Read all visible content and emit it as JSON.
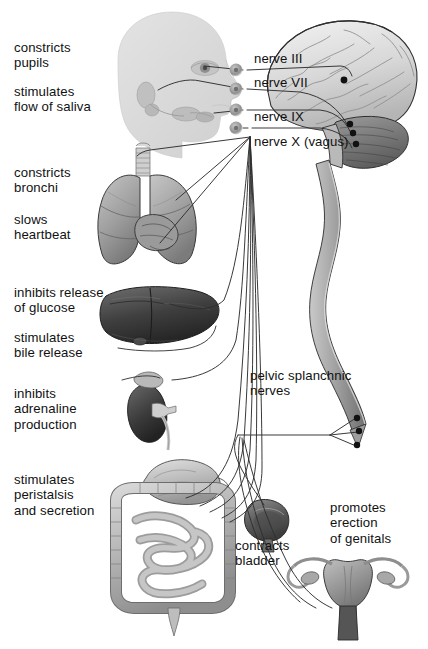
{
  "diagram": {
    "background_color": "#ffffff",
    "text_color": "#111111"
  },
  "labels": {
    "constricts_pupils": "constricts\npupils",
    "stimulates_saliva": "stimulates\nflow of saliva",
    "constricts_bronchi": "constricts\nbronchi",
    "slows_heartbeat": "slows\nheartbeat",
    "inhibits_glucose": "inhibits release\nof glucose",
    "stimulates_bile": "stimulates\nbile release",
    "inhibits_adrenaline": "inhibits\nadrenaline\nproduction",
    "stimulates_peristalsis": "stimulates\nperistalsis\nand secretion",
    "nerve_iii": "nerve III",
    "nerve_vii": "nerve VII",
    "nerve_ix": "nerve IX",
    "nerve_x": "nerve X (vagus)",
    "pelvic_splanchnic": "pelvic splanchnic\nnerves",
    "contracts_bladder": "contracts\nbladder",
    "promotes_erection": "promotes\nerection\nof genitals"
  },
  "structures": {
    "head": "head-profile-silhouette",
    "brain": "brain-cerebrum",
    "cerebellum": "cerebellum",
    "brainstem": "brainstem",
    "spinal_cord": "spinal-cord",
    "eye": "eye",
    "salivary_glands": "salivary-glands",
    "trachea": "trachea",
    "lungs": "lungs",
    "heart": "heart",
    "liver": "liver",
    "kidney": "kidney",
    "adrenal_gland": "adrenal-gland",
    "stomach": "stomach",
    "colon": "large-intestine",
    "small_intestine": "small-intestine",
    "appendix": "appendix",
    "bladder": "urinary-bladder",
    "uterus": "uterus",
    "ovaries": "ovaries"
  },
  "ganglia": {
    "count": 4,
    "color": "#9a9a9a"
  },
  "palette": {
    "organ_light": "#d2d2d2",
    "organ_mid": "#9e9e9e",
    "organ_dark": "#555555",
    "outline": "#2b2b2b",
    "nerve_line": "#2e2e2e",
    "head_fill": "#dcdcdc"
  }
}
